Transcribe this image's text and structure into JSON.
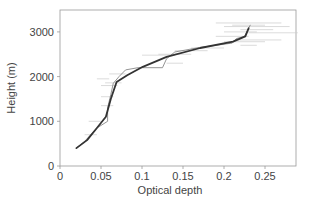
{
  "chart_data": {
    "type": "line",
    "title": "",
    "xlabel": "Optical depth",
    "ylabel": "Height (m)",
    "xlim": [
      0,
      0.29
    ],
    "ylim": [
      0,
      3500
    ],
    "xticks": [
      0,
      0.05,
      0.1,
      0.15,
      0.2,
      0.25
    ],
    "xtick_labels": [
      "0",
      "0.05",
      "0.1",
      "0.15",
      "0.2",
      "0.25"
    ],
    "yticks": [
      0,
      1000,
      2000,
      3000
    ],
    "ytick_labels": [
      "0",
      "1000",
      "2000",
      "3000"
    ],
    "grid": false,
    "legend": null,
    "series": [
      {
        "name": "smoothed profile",
        "style": "thick dark line",
        "color": "#333333",
        "points": [
          [
            0.02,
            400
          ],
          [
            0.033,
            580
          ],
          [
            0.045,
            850
          ],
          [
            0.056,
            1100
          ],
          [
            0.062,
            1500
          ],
          [
            0.069,
            1880
          ],
          [
            0.082,
            2030
          ],
          [
            0.101,
            2220
          ],
          [
            0.13,
            2440
          ],
          [
            0.171,
            2640
          ],
          [
            0.211,
            2780
          ],
          [
            0.226,
            2900
          ],
          [
            0.23,
            3080
          ]
        ]
      },
      {
        "name": "measured profile",
        "style": "thin gray line",
        "color": "#888888",
        "points": [
          [
            0.02,
            400
          ],
          [
            0.03,
            550
          ],
          [
            0.045,
            850
          ],
          [
            0.058,
            1000
          ],
          [
            0.058,
            1300
          ],
          [
            0.062,
            1600
          ],
          [
            0.065,
            1850
          ],
          [
            0.072,
            2000
          ],
          [
            0.08,
            2150
          ],
          [
            0.095,
            2200
          ],
          [
            0.125,
            2200
          ],
          [
            0.13,
            2400
          ],
          [
            0.14,
            2550
          ],
          [
            0.17,
            2650
          ],
          [
            0.21,
            2750
          ],
          [
            0.215,
            2850
          ],
          [
            0.225,
            2900
          ],
          [
            0.232,
            3150
          ]
        ]
      }
    ],
    "annotations": "faint horizontal scatter of individual measurements near heights 2600-3200 m"
  },
  "axes": {
    "xlabel": "Optical depth",
    "ylabel": "Height (m)"
  },
  "colors": {
    "frame": "#9a9a9a",
    "dark_line": "#333333",
    "thin_line": "#888888",
    "scatter": "#cccccc",
    "text": "#444444"
  }
}
